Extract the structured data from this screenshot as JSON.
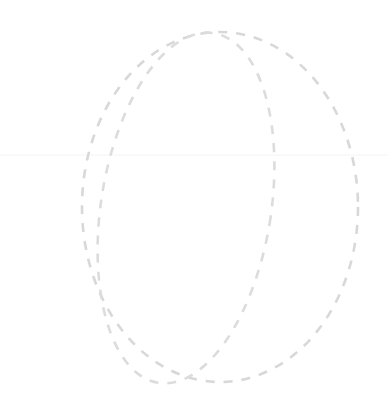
{
  "canvas": {
    "width": 388,
    "height": 415,
    "background_color": "#ffffff",
    "title": "Overlapping dashed ellipses"
  },
  "palette": {
    "stroke_color": "#d8d8d8",
    "stroke_color_secondary": "#dcdcdc",
    "guide_color": "#f4f4f4",
    "background": "#ffffff"
  },
  "shapes": [
    {
      "name": "outer-ellipse",
      "type": "ellipse",
      "center_x": 220,
      "center_y": 207,
      "radius_x": 138,
      "radius_y": 175,
      "rotation_deg": 0,
      "stroke_color": "#d8d8d8",
      "stroke_width": 2.6,
      "dash_on": 9,
      "dash_off": 9,
      "dash_offset": 0,
      "fill": "none"
    },
    {
      "name": "inner-ellipse",
      "type": "ellipse",
      "center_x": 186,
      "center_y": 208,
      "radius_x": 85,
      "radius_y": 177,
      "rotation_deg": 9,
      "stroke_color": "#dcdcdc",
      "stroke_width": 2.6,
      "dash_on": 9,
      "dash_off": 9,
      "dash_offset": 4,
      "fill": "none"
    }
  ],
  "guides": [
    {
      "name": "horizontal-guide",
      "type": "line",
      "x1": 0,
      "y1": 155,
      "x2": 388,
      "y2": 155,
      "stroke_color": "#f4f4f4",
      "stroke_width": 1
    }
  ],
  "intersections": [
    {
      "name": "top-intersection",
      "x": 230,
      "y": 47
    },
    {
      "name": "bottom-intersection",
      "x": 160,
      "y": 360
    }
  ],
  "chart_data": {
    "type": "scatter",
    "xlabel": "",
    "ylabel": "",
    "xlim": [
      0,
      388
    ],
    "ylim": [
      0,
      415
    ],
    "grid": false,
    "legend": "none",
    "series": [
      {
        "name": "outer-ellipse",
        "shape": "ellipse",
        "center": [
          220,
          207
        ],
        "radii": [
          138,
          175
        ],
        "rotation_deg": 0,
        "linestyle": "dashed",
        "color": "#d8d8d8"
      },
      {
        "name": "inner-ellipse",
        "shape": "ellipse",
        "center": [
          186,
          208
        ],
        "radii": [
          85,
          177
        ],
        "rotation_deg": 9,
        "linestyle": "dashed",
        "color": "#dcdcdc"
      }
    ],
    "annotations": []
  }
}
